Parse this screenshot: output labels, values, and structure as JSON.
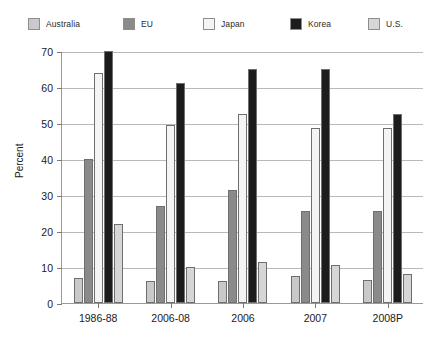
{
  "chart_data": {
    "type": "bar",
    "title": "",
    "xlabel": "",
    "ylabel": "Percent",
    "ylim": [
      0,
      70
    ],
    "ystep": 10,
    "grid": true,
    "legend_position": "top",
    "yticks": [
      "70",
      "60",
      "50",
      "40",
      "30",
      "20",
      "10",
      "0"
    ],
    "categories": [
      "1986-88",
      "2006-08",
      "2006",
      "2007",
      "2008P"
    ],
    "series": [
      {
        "name": "Australia",
        "color": "#c9c9c9",
        "values": [
          7,
          6,
          6,
          7.5,
          6.5
        ]
      },
      {
        "name": "EU",
        "color": "#8a8a8a",
        "values": [
          40,
          27,
          31.5,
          25.5,
          25.5
        ]
      },
      {
        "name": "Japan",
        "color": "#f4f4f4",
        "values": [
          64,
          49.5,
          52.5,
          48.5,
          48.5
        ]
      },
      {
        "name": "Korea",
        "color": "#1c1c1c",
        "values": [
          70,
          61,
          65,
          65,
          52.5
        ]
      },
      {
        "name": "U.S.",
        "color": "#d6d6d6",
        "values": [
          22,
          10,
          11.5,
          10.5,
          8
        ]
      }
    ]
  }
}
